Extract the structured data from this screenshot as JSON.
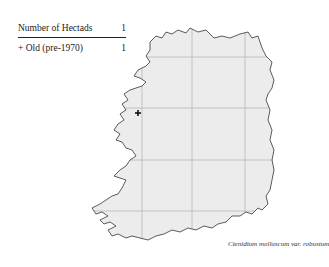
{
  "legend": {
    "rows": [
      {
        "label": "Number of Hectads",
        "value": "1"
      },
      {
        "label": "+ Old  (pre-1970)",
        "value": "1"
      }
    ]
  },
  "map": {
    "region": "Ireland",
    "land_color": "#ececec",
    "coast_color": "#333333",
    "grid_color": "#b8b8b8",
    "grid_x": [
      142,
      192,
      245
    ],
    "grid_y": [
      57,
      108,
      160,
      211
    ],
    "records": [
      {
        "type": "old-pre-1970",
        "x": 138,
        "y": 113
      }
    ]
  },
  "caption": "Ctenidium molluscum var. robustum"
}
